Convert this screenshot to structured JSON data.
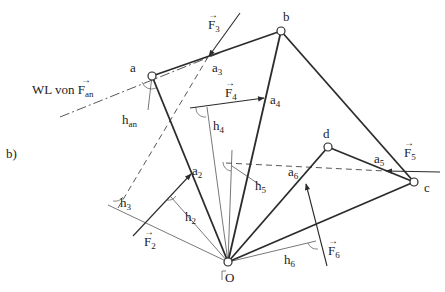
{
  "figure": {
    "panel_label": "b)",
    "points": {
      "a": "a",
      "b": "b",
      "c": "c",
      "d": "d",
      "O": "O"
    },
    "line_of_action": {
      "prefix": "WL von ",
      "force": "F",
      "force_sub": "an"
    },
    "forces": [
      {
        "name": "F",
        "sub": "2"
      },
      {
        "name": "F",
        "sub": "3"
      },
      {
        "name": "F",
        "sub": "4"
      },
      {
        "name": "F",
        "sub": "5"
      },
      {
        "name": "F",
        "sub": "6"
      }
    ],
    "attachment_points": [
      {
        "name": "a",
        "sub": "2"
      },
      {
        "name": "a",
        "sub": "3"
      },
      {
        "name": "a",
        "sub": "4"
      },
      {
        "name": "a",
        "sub": "5"
      },
      {
        "name": "a",
        "sub": "6"
      }
    ],
    "lever_arms": [
      {
        "name": "h",
        "sub": "an"
      },
      {
        "name": "h",
        "sub": "2"
      },
      {
        "name": "h",
        "sub": "3"
      },
      {
        "name": "h",
        "sub": "4"
      },
      {
        "name": "h",
        "sub": "5"
      },
      {
        "name": "h",
        "sub": "6"
      }
    ],
    "vector_arrow": "→"
  }
}
